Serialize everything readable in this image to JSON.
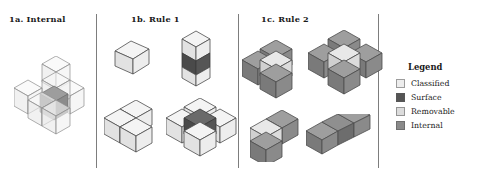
{
  "figure": {
    "background": "#ffffff",
    "divider_color": "#7d7d7d"
  },
  "panels": [
    {
      "id": "1a",
      "title": "1a. Internal"
    },
    {
      "id": "1b",
      "title": "1b. Rule 1"
    },
    {
      "id": "1c",
      "title": "1c. Rule 2"
    }
  ],
  "legend": {
    "title": "Legend",
    "items": [
      {
        "label": "Classified",
        "color": "#ededed"
      },
      {
        "label": "Surface",
        "color": "#555555"
      },
      {
        "label": "Removable",
        "color": "#dcdcdc"
      },
      {
        "label": "Internal",
        "color": "#8a8a8a"
      }
    ]
  },
  "colors": {
    "classified_top": "#f4f4f4",
    "classified_left": "#e2e2e2",
    "classified_right": "#ededed",
    "surface_top": "#6a6a6a",
    "surface_left": "#4a4a4a",
    "surface_right": "#555555",
    "removable_top": "#e8e8e8",
    "removable_left": "#d0d0d0",
    "removable_right": "#dcdcdc",
    "internal_top": "#9e9e9e",
    "internal_left": "#7a7a7a",
    "internal_right": "#8a8a8a",
    "edge": "#4d4d4d",
    "wire_edge": "#8c8c8c"
  },
  "shapes": [
    {
      "name": "internal-cross-wireframe",
      "panel": "1a",
      "description": "transparent 3D plus/cross of 7 cubes with shaded internal center cube"
    },
    {
      "name": "rule1-single-cube",
      "panel": "1b",
      "description": "single classified cube"
    },
    {
      "name": "rule1-vertical-triple",
      "panel": "1b",
      "description": "vertical stack of 3 cubes, middle cube surface-dark"
    },
    {
      "name": "rule1-tee-cluster",
      "panel": "1b",
      "description": "cluster of 4 classified cubes forming a tee"
    },
    {
      "name": "rule1-cross-cluster",
      "panel": "1b",
      "description": "cross cluster with dark surface center cube"
    },
    {
      "name": "rule2-tee-cluster",
      "panel": "1c",
      "description": "internal-gray tee cluster with removable light center cube"
    },
    {
      "name": "rule2-plus-cluster",
      "panel": "1c",
      "description": "internal-gray plus cluster with removable light center cube"
    },
    {
      "name": "rule2-corner-cluster",
      "panel": "1c",
      "description": "internal-gray corner cluster with removable light top cube"
    },
    {
      "name": "rule2-horizontal-triple",
      "panel": "1c",
      "description": "horizontal row of 3 internal cubes with darker surface center"
    }
  ]
}
